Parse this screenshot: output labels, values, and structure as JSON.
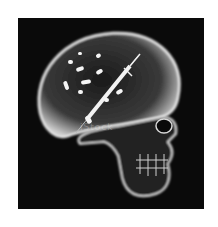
{
  "image": {
    "description": "X-ray style side view of a human skull with pills and a syringe inside the cranium, on a black background",
    "watermark": "iStock",
    "colors": {
      "background": "#0a0a0a",
      "frame": "#ffffff",
      "bone": "#e8e8e8"
    }
  }
}
